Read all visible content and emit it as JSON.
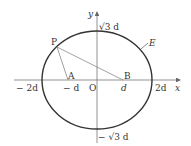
{
  "diagram": {
    "axes": {
      "x_label": "x",
      "y_label": "y",
      "origin_label": "O"
    },
    "ticks": {
      "neg2d": "− 2d",
      "negd": "− d",
      "d": "d",
      "pos2d": "2d",
      "sqrt3d": "√3 d",
      "negsqrt3d": "− √3 d"
    },
    "points": {
      "P": "P",
      "A": "A",
      "B": "B"
    },
    "curve_label": "E",
    "colors": {
      "ellipse": "#333333",
      "axes": "#666666",
      "lines": "#777777"
    }
  }
}
